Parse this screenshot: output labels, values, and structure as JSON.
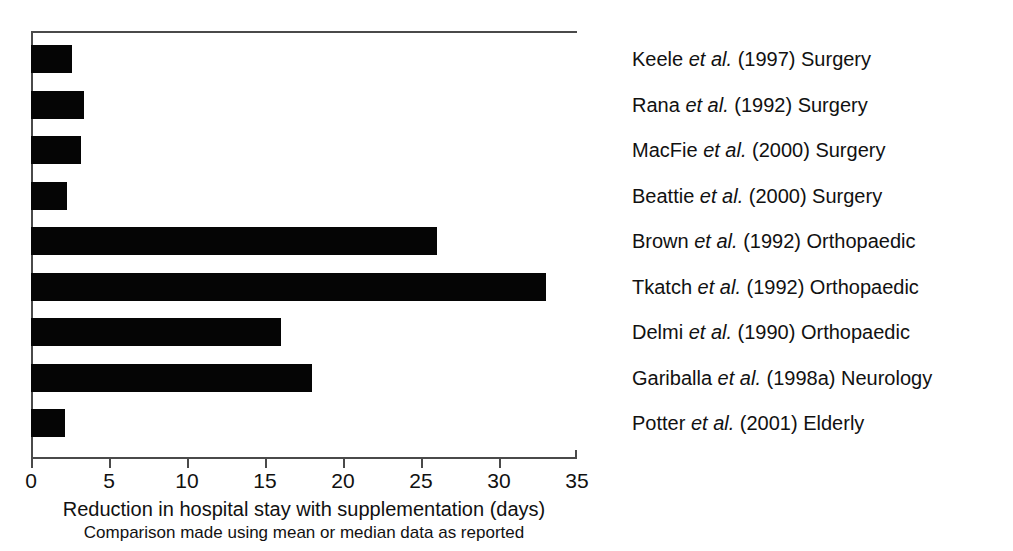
{
  "chart_data": {
    "type": "bar",
    "orientation": "horizontal",
    "title": "",
    "xlabel": "Reduction in hospital stay with supplementation (days)",
    "xsublabel": "Comparison made using mean or median data as reported",
    "ylabel": "",
    "xlim": [
      0,
      35
    ],
    "xticks": [
      0,
      5,
      10,
      15,
      20,
      25,
      30,
      35
    ],
    "xticklabels": [
      "0",
      "5",
      "10",
      "15",
      "20",
      "25",
      "30",
      "35"
    ],
    "grid": false,
    "legend": false,
    "bar_color": "#050505",
    "axis_color": "#4a4a4a",
    "categories": [
      "Keele et al. (1997) Surgery",
      "Rana et al. (1992) Surgery",
      "MacFie et al. (2000) Surgery",
      "Beattie et al. (2000) Surgery",
      "Brown et al. (1992) Orthopaedic",
      "Tkatch et al. (1992) Orthopaedic",
      "Delmi et al. (1990) Orthopaedic",
      "Gariballa et al. (1998a) Neurology",
      "Potter et al. (2001) Elderly"
    ],
    "values": [
      2.6,
      3.4,
      3.2,
      2.3,
      26,
      33,
      16,
      18,
      2.2
    ],
    "bars": [
      {
        "author": "Keele",
        "et_al": "et al.",
        "citation": "(1997)",
        "specialty": "Surgery",
        "value": 2.6
      },
      {
        "author": "Rana",
        "et_al": "et al.",
        "citation": "(1992)",
        "specialty": "Surgery",
        "value": 3.4
      },
      {
        "author": "MacFie",
        "et_al": "et al.",
        "citation": "(2000)",
        "specialty": "Surgery",
        "value": 3.2
      },
      {
        "author": "Beattie",
        "et_al": "et al.",
        "citation": "(2000)",
        "specialty": "Surgery",
        "value": 2.3
      },
      {
        "author": "Brown",
        "et_al": "et al.",
        "citation": "(1992)",
        "specialty": "Orthopaedic",
        "value": 26
      },
      {
        "author": "Tkatch",
        "et_al": "et al.",
        "citation": "(1992)",
        "specialty": "Orthopaedic",
        "value": 33
      },
      {
        "author": "Delmi",
        "et_al": "et al.",
        "citation": "(1990)",
        "specialty": "Orthopaedic",
        "value": 16
      },
      {
        "author": "Gariballa",
        "et_al": "et al.",
        "citation": "(1998a)",
        "specialty": "Neurology",
        "value": 18
      },
      {
        "author": "Potter",
        "et_al": "et al.",
        "citation": "(2001)",
        "specialty": "Elderly",
        "value": 2.2
      }
    ]
  }
}
